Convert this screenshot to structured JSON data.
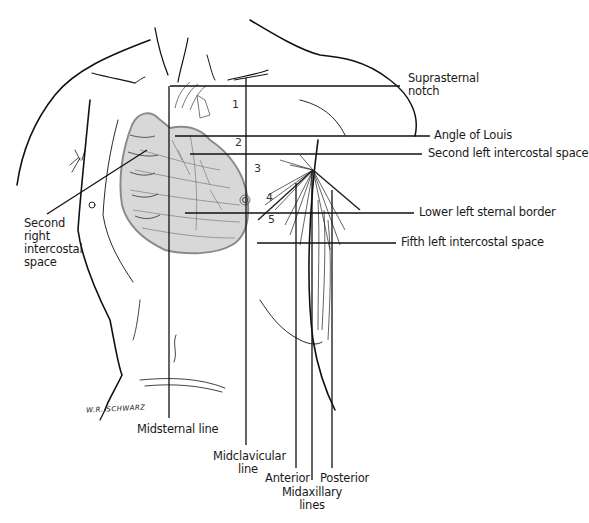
{
  "diagram": {
    "labels": {
      "suprasternal_notch": "Suprasternal\nnotch",
      "suprasternal_notch_l1": "Suprasternal",
      "suprasternal_notch_l2": "notch",
      "angle_of_louis": "Angle of Louis",
      "second_left_intercostal": "Second left intercostal space",
      "lower_left_sternal_border": "Lower left sternal border",
      "fifth_left_intercostal": "Fifth left intercostal space",
      "second_right_intercostal_l1": "Second",
      "second_right_intercostal_l2": "right",
      "second_right_intercostal_l3": "intercostal",
      "second_right_intercostal_l4": "space",
      "midsternal_line": "Midsternal line",
      "midclavicular_l1": "Midclavicular",
      "midclavicular_l2": "line",
      "anterior": "Anterior",
      "posterior": "Posterior",
      "midaxillary_l1": "Midaxillary",
      "midaxillary_l2": "lines"
    },
    "intercostal_numbers": [
      "1",
      "2",
      "3",
      "4",
      "5"
    ],
    "signature": "W.R. SCHWARZ",
    "colors": {
      "ink": "#111111",
      "heart_shade": "#8a8a8a",
      "background": "#ffffff"
    }
  }
}
